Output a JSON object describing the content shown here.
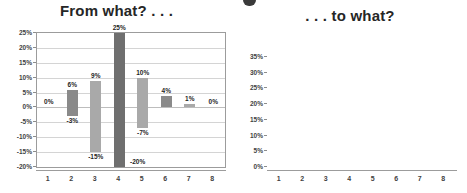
{
  "figure": {
    "cropped_heading_fragment": "",
    "panels": [
      "from-what",
      "to-what"
    ]
  },
  "left_panel": {
    "title": "From what? . . ."
  },
  "right_panel": {
    "title": ". . . to what?"
  },
  "colors": {
    "bar_dark": "#6f6f6f",
    "bar_medium": "#8a8a8a",
    "bar_light": "#a9a9a9",
    "bar_lightest": "#d2d2d2",
    "grid": "#d4d4d4",
    "frame": "#9c9c9c",
    "text": "#1f1f1f",
    "title": "#262626"
  },
  "chart_data": [
    {
      "type": "bar",
      "title": "From what? . . .",
      "subtype": "floating-range-bar",
      "xlabel": "",
      "ylabel": "",
      "categories": [
        "1",
        "2",
        "3",
        "4",
        "5",
        "6",
        "7",
        "8"
      ],
      "ylim": [
        -20,
        25
      ],
      "yticks": [
        -20,
        -15,
        -10,
        -5,
        0,
        5,
        10,
        15,
        20,
        25
      ],
      "ytick_labels": [
        "-20%",
        "-15%",
        "-10%",
        "-5%",
        "0%",
        "5%",
        "10%",
        "15%",
        "20%",
        "25%"
      ],
      "grid": true,
      "legend": "none",
      "bars": [
        {
          "category": "1",
          "low": 0,
          "high": 0,
          "top_label": "0%",
          "bottom_label": "",
          "color": "#8a8a8a"
        },
        {
          "category": "2",
          "low": -3,
          "high": 6,
          "top_label": "6%",
          "bottom_label": "-3%",
          "color": "#8a8a8a"
        },
        {
          "category": "3",
          "low": -15,
          "high": 9,
          "top_label": "9%",
          "bottom_label": "-15%",
          "color": "#a9a9a9"
        },
        {
          "category": "4",
          "low": -20,
          "high": 25,
          "top_label": "25%",
          "bottom_label": "-20%",
          "color": "#6f6f6f"
        },
        {
          "category": "5",
          "low": -7,
          "high": 10,
          "top_label": "10%",
          "bottom_label": "-7%",
          "color": "#a9a9a9"
        },
        {
          "category": "6",
          "low": 0,
          "high": 4,
          "top_label": "4%",
          "bottom_label": "",
          "color": "#8a8a8a"
        },
        {
          "category": "7",
          "low": 0,
          "high": 1,
          "top_label": "1%",
          "bottom_label": "",
          "color": "#a9a9a9"
        },
        {
          "category": "8",
          "low": 0,
          "high": 0,
          "top_label": "0%",
          "bottom_label": "",
          "color": "#a9a9a9"
        }
      ]
    },
    {
      "type": "bar",
      "title": ". . . to what?",
      "subtype": "column",
      "xlabel": "",
      "ylabel": "",
      "categories": [
        "1",
        "2",
        "3",
        "4",
        "5",
        "6",
        "7",
        "8"
      ],
      "values": [
        0,
        8,
        18,
        29,
        34,
        7,
        4,
        0
      ],
      "data_labels": [
        "0%",
        "8%",
        "18%",
        "29%",
        "34%",
        "7%",
        "4%",
        "0%"
      ],
      "ylim": [
        0,
        35
      ],
      "yticks": [
        0,
        5,
        10,
        15,
        20,
        25,
        30,
        35
      ],
      "ytick_labels": [
        "0%",
        "5%",
        "10%",
        "15%",
        "20%",
        "25%",
        "30%",
        "35%"
      ],
      "grid": true,
      "legend": "none",
      "bar_colors": [
        "#a9a9a9",
        "#8a8a8a",
        "#a9a9a9",
        "#6f6f6f",
        "#8a8a8a",
        "#8a8a8a",
        "#d2d2d2",
        "#a9a9a9"
      ]
    }
  ]
}
